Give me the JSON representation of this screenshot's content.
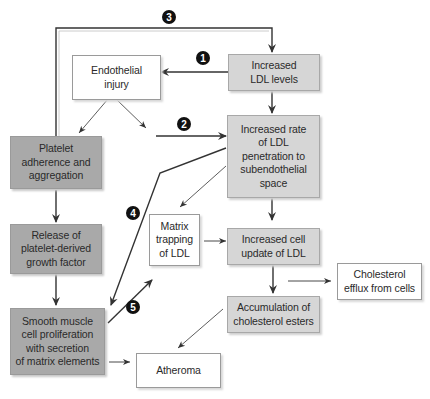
{
  "diagram": {
    "title": "",
    "nodes": {
      "endothelial_injury": {
        "label": "Endothelial\ninjury",
        "style": "white"
      },
      "increased_ldl": {
        "label": "Increased\nLDL levels",
        "style": "light"
      },
      "ldl_penetration": {
        "label": "Increased rate\nof LDL\npenetration to\nsubendothelial\nspace",
        "style": "light"
      },
      "platelet_adherence": {
        "label": "Platelet\nadherence and\naggregation",
        "style": "dark"
      },
      "release_pdgf": {
        "label": "Release of\nplatelet-derived\ngrowth factor",
        "style": "dark"
      },
      "smooth_muscle": {
        "label": "Smooth muscle\ncell proliferation\nwith secretion\nof matrix elements",
        "style": "dark"
      },
      "matrix_trapping": {
        "label": "Matrix\ntrapping\nof LDL",
        "style": "white"
      },
      "cell_uptake": {
        "label": "Increased cell\nupdate of LDL",
        "style": "light"
      },
      "cholesterol_efflux": {
        "label": "Cholesterol\nefflux from cells",
        "style": "white"
      },
      "accumulation": {
        "label": "Accumulation of\ncholesterol esters",
        "style": "light"
      },
      "atheroma": {
        "label": "Atheroma",
        "style": "white"
      }
    },
    "badges": [
      "1",
      "2",
      "3",
      "4",
      "5"
    ],
    "edges": [
      {
        "from": "increased_ldl",
        "to": "endothelial_injury",
        "badge": "1"
      },
      {
        "from": "endothelial_injury",
        "to": "ldl_penetration",
        "badge": "2"
      },
      {
        "from": "platelet_adherence",
        "to": "increased_ldl",
        "badge": "3"
      },
      {
        "from": "ldl_penetration",
        "to": "smooth_muscle",
        "badge": "4"
      },
      {
        "from": "smooth_muscle",
        "to": "matrix_trapping",
        "badge": "5"
      },
      {
        "from": "endothelial_injury",
        "to": "platelet_adherence"
      },
      {
        "from": "increased_ldl",
        "to": "ldl_penetration"
      },
      {
        "from": "ldl_penetration",
        "to": "matrix_trapping"
      },
      {
        "from": "ldl_penetration",
        "to": "cell_uptake"
      },
      {
        "from": "platelet_adherence",
        "to": "release_pdgf"
      },
      {
        "from": "release_pdgf",
        "to": "smooth_muscle"
      },
      {
        "from": "matrix_trapping",
        "to": "cell_uptake"
      },
      {
        "from": "cell_uptake",
        "to": "accumulation"
      },
      {
        "from": "cell_uptake",
        "to": "cholesterol_efflux"
      },
      {
        "from": "accumulation",
        "to": "atheroma"
      },
      {
        "from": "smooth_muscle",
        "to": "atheroma"
      }
    ],
    "colors": {
      "dark_box": "#a9a9a9",
      "light_box": "#d6d6d6",
      "white_box": "#ffffff",
      "line": "#333333",
      "badge": "#111111"
    }
  }
}
